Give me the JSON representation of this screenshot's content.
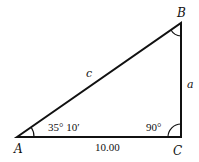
{
  "diagram": {
    "type": "right-triangle",
    "vertices": {
      "A": {
        "label": "A",
        "x": 17,
        "y": 137
      },
      "B": {
        "label": "B",
        "x": 181,
        "y": 23
      },
      "C": {
        "label": "C",
        "x": 181,
        "y": 137
      }
    },
    "sides": {
      "c": {
        "label": "c",
        "between": "A-B"
      },
      "a": {
        "label": "a",
        "between": "B-C"
      },
      "b": {
        "label": "10.00",
        "between": "A-C"
      }
    },
    "angles": {
      "A": {
        "label": "35° 10′"
      },
      "C": {
        "label": "90°"
      },
      "B": {
        "label": ""
      }
    },
    "stroke_color": "#111111"
  }
}
